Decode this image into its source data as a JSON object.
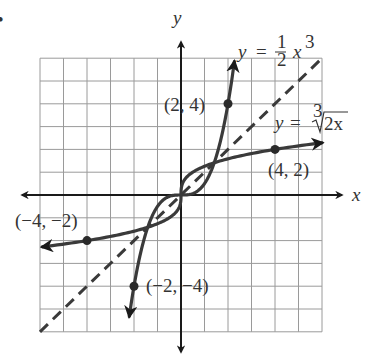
{
  "chart_data": {
    "type": "line",
    "title": "",
    "xlabel": "x",
    "ylabel": "y",
    "xlim": [
      -6,
      6
    ],
    "ylim": [
      -6,
      6
    ],
    "grid": true,
    "grid_step": 1,
    "series": [
      {
        "name": "y = (1/2) x^3",
        "label_text": "y = ½ x³",
        "style": "solid-arrows",
        "x_range": [
          -2.2,
          2.27
        ],
        "function": "0.5*x^3"
      },
      {
        "name": "y = cube root of (2x)",
        "label_text": "y = ∛2x",
        "style": "solid-arrows",
        "x_range": [
          -5.9,
          6
        ],
        "function": "cbrt(2x)"
      },
      {
        "name": "y = x",
        "style": "dashed",
        "x_range": [
          -6,
          6
        ],
        "function": "x"
      }
    ],
    "points": [
      {
        "x": 2,
        "y": 4,
        "label": "(2, 4)"
      },
      {
        "x": 4,
        "y": 2,
        "label": "(4, 2)"
      },
      {
        "x": -4,
        "y": -2,
        "label": "(−4, −2)"
      },
      {
        "x": -2,
        "y": -4,
        "label": "(−2, −4)"
      }
    ],
    "annotations": [
      "y = ½ x³",
      "y = ∛2x"
    ]
  },
  "labels": {
    "x_axis": "x",
    "y_axis": "y",
    "cubic_y": "y",
    "cubic_eq": "=",
    "cubic_num": "1",
    "cubic_den": "2",
    "cubic_x": "x",
    "cubic_exp": "3",
    "root_y": "y",
    "root_eq": "=",
    "root_index": "3",
    "root_arg": "2x",
    "p1": "(2, 4)",
    "p2": "(4, 2)",
    "p3": "(−4, −2)",
    "p4": "(−2, −4)",
    "bullet": "•"
  }
}
